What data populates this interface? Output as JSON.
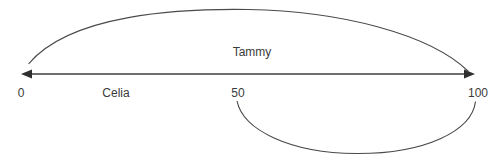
{
  "diagram": {
    "type": "number-line-with-spans",
    "background_color": "#ffffff",
    "line_color": "#3f3f3f",
    "text_color": "#3b3b3b",
    "axis": {
      "name": "number-line",
      "min_label": "0",
      "mid_label": "50",
      "max_label": "100",
      "min_value": 0,
      "mid_value": 50,
      "max_value": 100,
      "left_arrowhead": "arrow-left-icon",
      "right_arrowhead": "arrow-right-icon"
    },
    "tick_labels": [
      {
        "text": "0",
        "value": 0,
        "x": 21,
        "y": 97
      },
      {
        "text": "50",
        "value": 50,
        "x": 238,
        "y": 97
      },
      {
        "text": "100",
        "value": 100,
        "x": 478,
        "y": 97
      }
    ],
    "spans": [
      {
        "name": "tammy-span",
        "label": "Tammy",
        "from": 0,
        "to": 100,
        "arc_side": "above",
        "label_x": 252,
        "label_y": 56
      },
      {
        "name": "celia-span",
        "label": "Celia",
        "from": 50,
        "to": 100,
        "arc_side": "below",
        "label_x": 116,
        "label_y": 97
      }
    ]
  }
}
